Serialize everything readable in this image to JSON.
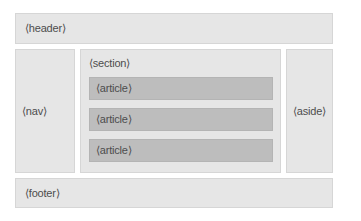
{
  "diagram": {
    "colors": {
      "block": "#e6e6e6",
      "article": "#bdbdbd",
      "text": "#4d4d4d"
    },
    "header": {
      "label": "⟨header⟩"
    },
    "nav": {
      "label": "⟨nav⟩"
    },
    "section": {
      "label": "⟨section⟩",
      "articles": [
        {
          "label": "⟨article⟩"
        },
        {
          "label": "⟨article⟩"
        },
        {
          "label": "⟨article⟩"
        }
      ]
    },
    "aside": {
      "label": "⟨aside⟩"
    },
    "footer": {
      "label": "⟨footer⟩"
    }
  }
}
